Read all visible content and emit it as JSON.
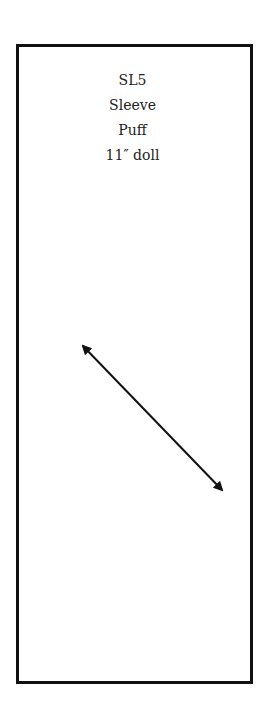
{
  "pattern": {
    "code": "SL5",
    "line2": "Sleeve",
    "line3": "Puff",
    "line4": "11″ doll"
  },
  "grainline": {
    "icon": "double-headed-arrow-icon",
    "x1": 81,
    "y1": 344,
    "x2": 224,
    "y2": 492,
    "color": "#111111"
  },
  "frame": {
    "border_color": "#111111"
  }
}
